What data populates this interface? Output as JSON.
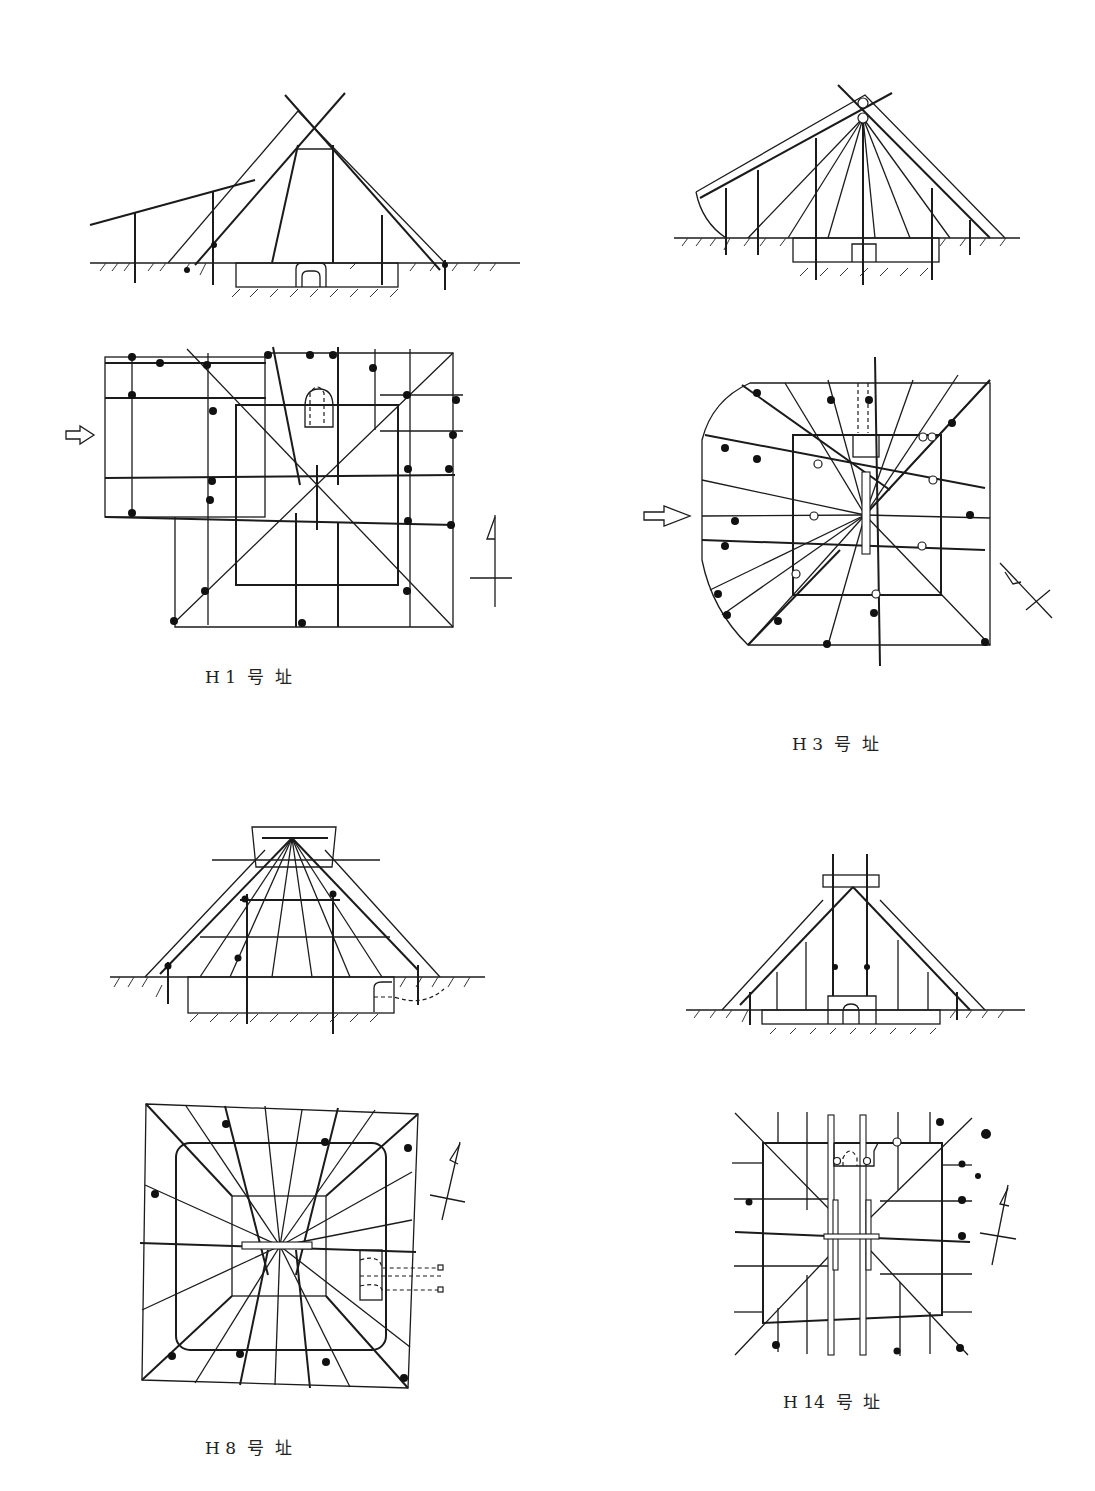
{
  "page": {
    "header": {
      "text": ""
    }
  },
  "figures": [
    {
      "id": "H1",
      "caption": "H 1  号  址",
      "views": [
        "section",
        "plan"
      ],
      "entrance_arrow": "arrow-right-icon",
      "north_marker": "north-arrow-icon"
    },
    {
      "id": "H3",
      "caption": "H 3  号  址",
      "views": [
        "section",
        "plan"
      ],
      "entrance_arrow": "arrow-right-icon",
      "north_marker": "north-arrow-icon"
    },
    {
      "id": "H8",
      "caption": "H 8  号  址",
      "views": [
        "section",
        "plan"
      ],
      "north_marker": "north-arrow-icon"
    },
    {
      "id": "H14",
      "caption": "H 14  号  址",
      "views": [
        "section",
        "plan"
      ],
      "north_marker": "north-arrow-icon"
    }
  ],
  "colors": {
    "ink": "#1b1b1b",
    "paper": "#ffffff"
  }
}
